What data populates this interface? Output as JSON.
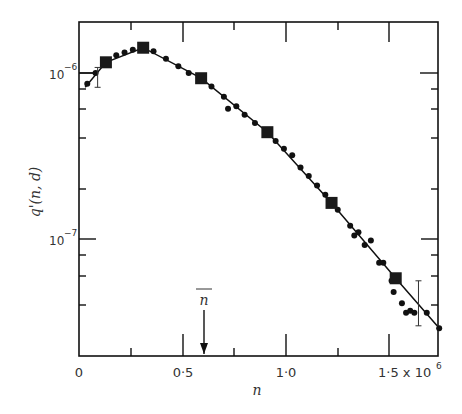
{
  "chart_data": {
    "type": "scatter",
    "title": "",
    "xlabel": "n",
    "ylabel": "q'(n, d)",
    "x_scale": "linear",
    "y_scale": "log",
    "xlim": [
      0,
      1750000.0
    ],
    "ylim": [
      2e-08,
      2.05e-06
    ],
    "x_ticks": [
      0,
      500000.0,
      1000000.0,
      1500000.0
    ],
    "x_tick_labels": [
      "0",
      "0·5",
      "1·0",
      "1·5 x 10⁶"
    ],
    "x_minor_ticks": [
      250000.0,
      750000.0,
      1250000.0
    ],
    "y_ticks": [
      1e-07,
      1e-06
    ],
    "y_tick_labels": [
      "10⁻⁷",
      "10⁻⁶"
    ],
    "grid": false,
    "legend": null,
    "annotations": [
      {
        "text": "n̄",
        "type": "arrow",
        "x": 600000.0,
        "description": "mean n marked with downward arrow"
      }
    ],
    "series": [
      {
        "name": "fitted curve",
        "style": "line",
        "x": [
          30000.0,
          130000.0,
          310000.0,
          590000.0,
          910000.0,
          1220000.0,
          1530000.0,
          1730000.0
        ],
        "values": [
          8.2e-07,
          1.16e-06,
          1.42e-06,
          9.3e-07,
          4.4e-07,
          1.65e-07,
          5.8e-08,
          3e-08
        ]
      },
      {
        "name": "binned points (squares)",
        "style": "square",
        "x": [
          130000.0,
          310000.0,
          590000.0,
          910000.0,
          1220000.0,
          1530000.0
        ],
        "values": [
          1.16e-06,
          1.42e-06,
          9.3e-07,
          4.4e-07,
          1.65e-07,
          5.8e-08
        ]
      },
      {
        "name": "data points (dots)",
        "style": "dot",
        "x": [
          40000.0,
          80000.0,
          180000.0,
          220000.0,
          260000.0,
          360000.0,
          420000.0,
          480000.0,
          530000.0,
          640000.0,
          700000.0,
          720000.0,
          760000.0,
          800000.0,
          850000.0,
          950000.0,
          990000.0,
          1030000.0,
          1070000.0,
          1110000.0,
          1150000.0,
          1190000.0,
          1250000.0,
          1310000.0,
          1330000.0,
          1350000.0,
          1380000.0,
          1410000.0,
          1450000.0,
          1470000.0,
          1510000.0,
          1520000.0,
          1560000.0,
          1580000.0,
          1600000.0,
          1620000.0,
          1680000.0,
          1740000.0
        ],
        "values": [
          8.6e-07,
          1e-06,
          1.28e-06,
          1.33e-06,
          1.38e-06,
          1.35e-06,
          1.22e-06,
          1.1e-06,
          1e-06,
          8.3e-07,
          7.2e-07,
          6.1e-07,
          6.3e-07,
          5.6e-07,
          5e-07,
          3.9e-07,
          3.5e-07,
          3.2e-07,
          2.7e-07,
          2.4e-07,
          2.1e-07,
          1.85e-07,
          1.5e-07,
          1.2e-07,
          1.05e-07,
          1.1e-07,
          9.2e-08,
          9.8e-08,
          7.2e-08,
          7.2e-08,
          5.6e-08,
          4.8e-08,
          4.1e-08,
          3.6e-08,
          3.7e-08,
          3.6e-08,
          3.6e-08,
          2.9e-08
        ]
      }
    ],
    "error_bars": [
      {
        "x": 90000.0,
        "y": 9.5e-07,
        "low": 8.2e-07,
        "high": 1.08e-06
      },
      {
        "x": 1640000.0,
        "y": 4.3e-08,
        "low": 3e-08,
        "high": 5.6e-08
      }
    ]
  },
  "axes": {
    "xlabel": "n",
    "ylabel": "q'(n, d)",
    "xtick_0": "0",
    "xtick_05": "0·5",
    "xtick_10": "1·0",
    "xtick_15": "1·5 x 10",
    "xtick_exp": "6",
    "ytick_6_base": "10",
    "ytick_6_exp": "−6",
    "ytick_7_base": "10",
    "ytick_7_exp": "−7",
    "nbar": "n"
  }
}
